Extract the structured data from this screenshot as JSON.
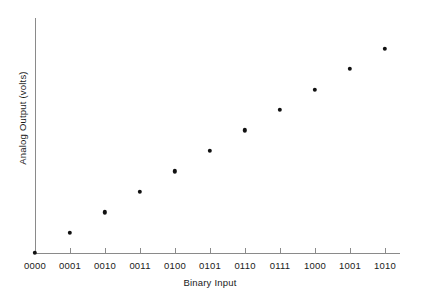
{
  "chart_data": {
    "type": "scatter",
    "title": "",
    "xlabel": "Binary Input",
    "ylabel": "Analog Output (volts)",
    "categories": [
      "0000",
      "0001",
      "0010",
      "0011",
      "0100",
      "0101",
      "0110",
      "0111",
      "1000",
      "1001",
      "1010"
    ],
    "values": [
      0,
      1,
      2,
      3,
      4,
      5,
      6,
      7,
      8,
      9,
      10
    ],
    "xlim": [
      0,
      10
    ],
    "ylim": [
      0,
      11.5
    ],
    "grid": false,
    "legend": null,
    "marker": "filled-circle",
    "marker_color": "#111111",
    "axis_color": "#8a8a8a",
    "background_color": "#ffffff",
    "y_ticks_visible": false,
    "x_ticks_visible": true
  },
  "axes": {
    "x_title": "Binary Input",
    "y_title": "Analog Output (volts)",
    "x_tick_labels": [
      "0000",
      "0001",
      "0010",
      "0011",
      "0100",
      "0101",
      "0110",
      "0111",
      "1000",
      "1001",
      "1010"
    ]
  }
}
